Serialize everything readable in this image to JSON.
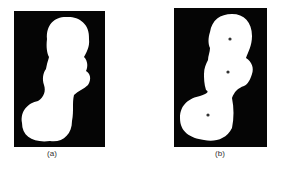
{
  "figure": {
    "panels": [
      {
        "id": "a",
        "caption": "(a)",
        "description": "binary silhouette (white blob on black background)",
        "colors": {
          "background": "#050505",
          "shape": "#ffffff"
        }
      },
      {
        "id": "b",
        "caption": "(b)",
        "description": "binary silhouette with three marked points",
        "colors": {
          "background": "#050505",
          "shape": "#ffffff",
          "marker": "#333333"
        },
        "markers": 3
      }
    ]
  }
}
